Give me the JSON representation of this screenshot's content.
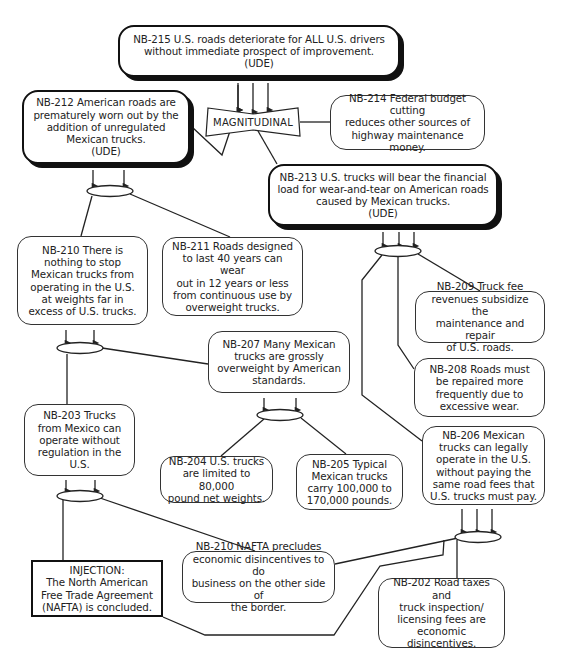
{
  "diagram": {
    "type": "current-reality-tree",
    "nodes": {
      "nb215": {
        "id": "NB-215",
        "text": "NB-215 U.S. roads deteriorate for ALL U.S. drivers\nwithout immediate prospect of improvement.\n(UDE)",
        "kind": "UDE"
      },
      "nb212": {
        "id": "NB-212",
        "text": "NB-212 American roads are\nprematurely worn out by the\naddition of unregulated\nMexican trucks.\n(UDE)",
        "kind": "UDE"
      },
      "magnitudinal": {
        "text": "MAGNITUDINAL",
        "kind": "magnitudinal-and"
      },
      "nb214": {
        "id": "NB-214",
        "text": "NB-214 Federal budget cutting\nreduces other sources of\nhighway maintenance money.",
        "kind": "entity"
      },
      "nb213": {
        "id": "NB-213",
        "text": "NB-213 U.S. trucks will bear the financial\nload for wear-and-tear on American roads\ncaused by Mexican trucks.\n(UDE)",
        "kind": "UDE"
      },
      "nb210": {
        "id": "NB-210",
        "text": "NB-210 There is\nnothing to stop\nMexican trucks from\noperating in the U.S.\nat weights far in\nexcess of U.S. trucks.",
        "kind": "entity"
      },
      "nb211": {
        "id": "NB-211",
        "text": "NB-211 Roads designed\nto last 40 years can wear\nout in 12 years or less\nfrom continuous use by\noverweight trucks.",
        "kind": "entity"
      },
      "nb209": {
        "id": "NB-209",
        "text": "NB-209 Truck fee\nrevenues subsidize the\nmaintenance and repair\nof U.S. roads.",
        "kind": "entity"
      },
      "nb208": {
        "id": "NB-208",
        "text": "NB-208 Roads must\nbe repaired more\nfrequently due to\nexcessive wear.",
        "kind": "entity"
      },
      "nb207": {
        "id": "NB-207",
        "text": "NB-207 Many Mexican\ntrucks are grossly\noverweight by American\nstandards.",
        "kind": "entity"
      },
      "nb203": {
        "id": "NB-203",
        "text": "NB-203 Trucks\nfrom Mexico can\noperate without\nregulation in the\nU.S.",
        "kind": "entity"
      },
      "nb204": {
        "id": "NB-204",
        "text": "NB-204 U.S. trucks\nare limited to 80,000\npound net weights.",
        "kind": "entity"
      },
      "nb205": {
        "id": "NB-205",
        "text": "NB-205 Typical\nMexican trucks\ncarry 100,000 to\n170,000 pounds.",
        "kind": "entity"
      },
      "nb206": {
        "id": "NB-206",
        "text": "NB-206 Mexican\ntrucks can legally\noperate in the U.S.\nwithout paying the\nsame road fees that\nU.S. trucks must pay.",
        "kind": "entity"
      },
      "injection": {
        "text": "INJECTION:\nThe North American\nFree Trade Agreement\n(NAFTA) is concluded.",
        "kind": "injection"
      },
      "nb210b": {
        "id": "NB-210",
        "text": "NB-210 NAFTA precludes\neconomic disincentives to do\nbusiness on the other side of\nthe border.",
        "kind": "entity"
      },
      "nb202": {
        "id": "NB-202",
        "text": "NB-202 Road taxes and\ntruck inspection/\nlicensing fees are\neconomic disincentives.",
        "kind": "entity"
      }
    },
    "edges": [
      {
        "from": [
          "NB-212",
          "NB-213",
          "NB-214"
        ],
        "via": "MAGNITUDINAL",
        "to": "NB-215"
      },
      {
        "from": [
          "NB-210",
          "NB-211"
        ],
        "via": "ellipse",
        "to": "NB-212"
      },
      {
        "from": [
          "NB-206",
          "NB-208",
          "NB-209"
        ],
        "via": "ellipse",
        "to": "NB-213"
      },
      {
        "from": [
          "NB-203",
          "NB-207"
        ],
        "via": "ellipse",
        "to": "NB-210"
      },
      {
        "from": [
          "NB-204",
          "NB-205"
        ],
        "via": "ellipse",
        "to": "NB-207"
      },
      {
        "from": [
          "INJECTION",
          "NB-210 NAFTA"
        ],
        "via": "ellipse",
        "to": "NB-203"
      },
      {
        "from": [
          "NB-210 NAFTA",
          "INJECTION",
          "NB-202"
        ],
        "via": "ellipse",
        "to": "NB-206"
      }
    ],
    "colors": {
      "line": "#222222",
      "background": "#ffffff",
      "shadow": "#111111"
    }
  }
}
